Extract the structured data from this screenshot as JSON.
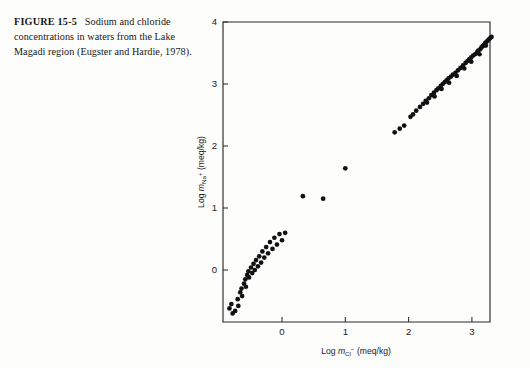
{
  "caption": {
    "figure_number": "FIGURE 15-5",
    "text": "Sodium and chloride concentrations in waters from the Lake Magadi region (Eugster and Hardie, 1978)."
  },
  "axes": {
    "x_title_prefix": "Log",
    "x_title_symbol": "m",
    "x_title_sub": "Cl",
    "x_title_sup": "−",
    "x_title_units": "(meq/kg)",
    "x_title_full": "Log m_Cl− (meq/kg)",
    "y_title_prefix": "Log",
    "y_title_symbol": "m",
    "y_title_sub": "Na",
    "y_title_sup": "+",
    "y_title_units": "(meq/kg)",
    "y_title_full": "Log m_Na+ (meq/kg)",
    "x_ticks": [
      "0",
      "1",
      "2",
      "3"
    ],
    "y_ticks": [
      "0",
      "1",
      "2",
      "3",
      "4"
    ]
  },
  "colors": {
    "background": "#fdfdfb",
    "ink": "#16161a",
    "axis": "#2a2a2e",
    "point": "#111114"
  },
  "chart_data": {
    "type": "scatter",
    "title": "Sodium and chloride concentrations in waters from the Lake Magadi region",
    "xlabel": "Log m_Cl− (meq/kg)",
    "ylabel": "Log m_Na+ (meq/kg)",
    "xlim": [
      -0.95,
      3.65
    ],
    "ylim": [
      -0.78,
      4.05
    ],
    "xticks": [
      0,
      1,
      2,
      3
    ],
    "yticks": [
      0,
      1,
      2,
      3,
      4
    ],
    "grid": false,
    "legend": false,
    "marker": "filled-circle",
    "series": [
      {
        "name": "Lake Magadi waters",
        "points": [
          [
            -0.83,
            -0.62
          ],
          [
            -0.8,
            -0.55
          ],
          [
            -0.78,
            -0.7
          ],
          [
            -0.74,
            -0.66
          ],
          [
            -0.7,
            -0.47
          ],
          [
            -0.69,
            -0.58
          ],
          [
            -0.66,
            -0.36
          ],
          [
            -0.64,
            -0.3
          ],
          [
            -0.63,
            -0.42
          ],
          [
            -0.6,
            -0.22
          ],
          [
            -0.58,
            -0.15
          ],
          [
            -0.57,
            -0.27
          ],
          [
            -0.55,
            -0.08
          ],
          [
            -0.53,
            -0.02
          ],
          [
            -0.52,
            -0.12
          ],
          [
            -0.49,
            0.04
          ],
          [
            -0.47,
            -0.05
          ],
          [
            -0.45,
            0.1
          ],
          [
            -0.43,
            0.0
          ],
          [
            -0.41,
            0.16
          ],
          [
            -0.38,
            0.06
          ],
          [
            -0.36,
            0.22
          ],
          [
            -0.33,
            0.12
          ],
          [
            -0.31,
            0.3
          ],
          [
            -0.28,
            0.2
          ],
          [
            -0.25,
            0.37
          ],
          [
            -0.22,
            0.27
          ],
          [
            -0.19,
            0.45
          ],
          [
            -0.15,
            0.34
          ],
          [
            -0.12,
            0.52
          ],
          [
            -0.08,
            0.41
          ],
          [
            -0.04,
            0.58
          ],
          [
            0.0,
            0.48
          ],
          [
            0.05,
            0.6
          ],
          [
            0.33,
            1.19
          ],
          [
            0.65,
            1.15
          ],
          [
            1.0,
            1.64
          ],
          [
            1.78,
            2.22
          ],
          [
            1.86,
            2.28
          ],
          [
            1.93,
            2.33
          ],
          [
            2.03,
            2.47
          ],
          [
            2.07,
            2.51
          ],
          [
            2.12,
            2.57
          ],
          [
            2.18,
            2.63
          ],
          [
            2.23,
            2.68
          ],
          [
            2.27,
            2.73
          ],
          [
            2.32,
            2.77
          ],
          [
            2.36,
            2.82
          ],
          [
            2.4,
            2.86
          ],
          [
            2.44,
            2.9
          ],
          [
            2.47,
            2.93
          ],
          [
            2.51,
            2.97
          ],
          [
            2.54,
            3.0
          ],
          [
            2.57,
            3.03
          ],
          [
            2.6,
            3.06
          ],
          [
            2.63,
            3.09
          ],
          [
            2.67,
            3.12
          ],
          [
            2.7,
            3.15
          ],
          [
            2.74,
            3.18
          ],
          [
            2.78,
            3.22
          ],
          [
            2.82,
            3.26
          ],
          [
            2.86,
            3.3
          ],
          [
            2.9,
            3.34
          ],
          [
            2.93,
            3.37
          ],
          [
            2.96,
            3.4
          ],
          [
            2.99,
            3.43
          ],
          [
            3.02,
            3.46
          ],
          [
            3.05,
            3.48
          ],
          [
            3.08,
            3.51
          ],
          [
            3.1,
            3.54
          ],
          [
            3.13,
            3.56
          ],
          [
            3.15,
            3.59
          ],
          [
            3.17,
            3.61
          ],
          [
            3.19,
            3.63
          ],
          [
            3.21,
            3.66
          ],
          [
            3.23,
            3.68
          ],
          [
            3.25,
            3.7
          ],
          [
            3.27,
            3.72
          ],
          [
            3.29,
            3.74
          ],
          [
            3.31,
            3.76
          ],
          [
            3.33,
            3.78
          ],
          [
            3.35,
            3.79
          ],
          [
            3.37,
            3.81
          ],
          [
            3.39,
            3.82
          ],
          [
            3.41,
            3.84
          ],
          [
            3.43,
            3.8
          ],
          [
            3.45,
            3.76
          ],
          [
            3.34,
            3.7
          ],
          [
            3.22,
            3.62
          ],
          [
            3.12,
            3.48
          ],
          [
            2.99,
            3.36
          ],
          [
            2.88,
            3.25
          ],
          [
            2.76,
            3.13
          ],
          [
            2.64,
            3.02
          ],
          [
            2.52,
            2.92
          ],
          [
            2.41,
            2.8
          ],
          [
            2.29,
            2.7
          ]
        ]
      }
    ]
  }
}
